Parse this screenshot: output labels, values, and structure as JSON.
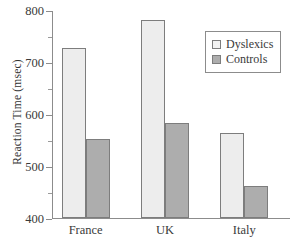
{
  "chart_data": {
    "type": "bar",
    "title": "",
    "xlabel": "",
    "ylabel": "Reaction Time (msec)",
    "categories": [
      "France",
      "UK",
      "Italy"
    ],
    "series": [
      {
        "name": "Dyslexics",
        "color": "#ededed",
        "values": [
          727,
          780,
          563
        ]
      },
      {
        "name": "Controls",
        "color": "#adadad",
        "values": [
          552,
          582,
          462
        ]
      }
    ],
    "ylim": [
      400,
      800
    ],
    "ytick_labels": [
      "400",
      "500",
      "600",
      "700",
      "800"
    ],
    "ytick_values": [
      400,
      500,
      600,
      700,
      800
    ],
    "yminor_values": [
      450,
      550,
      650,
      750
    ],
    "grid": false,
    "legend_position": "top-right",
    "legend_entries": [
      "Dyslexics",
      "Controls"
    ]
  },
  "legend": {
    "dyslexics_label": "Dyslexics",
    "controls_label": "Controls"
  },
  "axis": {
    "y_title": "Reaction Time (msec)"
  }
}
